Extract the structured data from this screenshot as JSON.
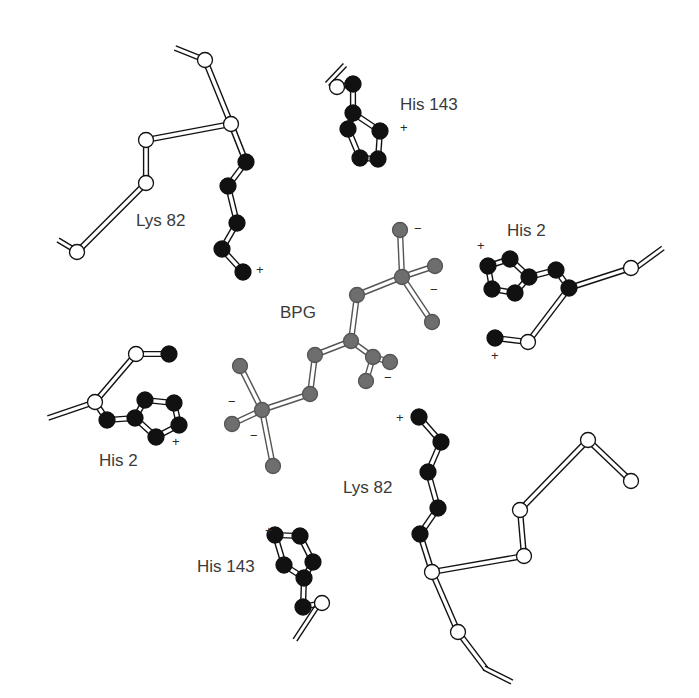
{
  "colors": {
    "backbone_fill": "#ffffff",
    "sidechain_fill": "#111111",
    "bpg_fill": "#6e6e6e",
    "stroke": "#111111",
    "bpg_stroke": "#555555"
  },
  "labels": [
    {
      "id": "lys82-top",
      "text": "Lys 82",
      "x": 136,
      "y": 226
    },
    {
      "id": "his143-top",
      "text": "His 143",
      "x": 400,
      "y": 110
    },
    {
      "id": "his2-right",
      "text": "His 2",
      "x": 507,
      "y": 236
    },
    {
      "id": "bpg",
      "text": "BPG",
      "x": 280,
      "y": 318
    },
    {
      "id": "his2-left",
      "text": "His 2",
      "x": 99,
      "y": 466
    },
    {
      "id": "lys82-bottom",
      "text": "Lys 82",
      "x": 343,
      "y": 493
    },
    {
      "id": "his143-bottom",
      "text": "His 143",
      "x": 197,
      "y": 572
    }
  ],
  "charges": [
    {
      "sign": "+",
      "x": 256,
      "y": 274
    },
    {
      "sign": "+",
      "x": 400,
      "y": 132
    },
    {
      "sign": "+",
      "x": 477,
      "y": 250
    },
    {
      "sign": "+",
      "x": 491,
      "y": 360
    },
    {
      "sign": "+",
      "x": 172,
      "y": 446
    },
    {
      "sign": "+",
      "x": 396,
      "y": 422
    },
    {
      "sign": "+",
      "x": 265,
      "y": 535
    },
    {
      "sign": "−",
      "x": 414,
      "y": 233
    },
    {
      "sign": "−",
      "x": 430,
      "y": 294
    },
    {
      "sign": "−",
      "x": 384,
      "y": 382
    },
    {
      "sign": "−",
      "x": 228,
      "y": 406
    },
    {
      "sign": "−",
      "x": 250,
      "y": 440
    }
  ],
  "stubs": [
    [
      175,
      48,
      205,
      60
    ],
    [
      58,
      240,
      78,
      252
    ],
    [
      327,
      84,
      345,
      65
    ],
    [
      633,
      270,
      663,
      248
    ],
    [
      48,
      418,
      95,
      402
    ],
    [
      295,
      640,
      318,
      605
    ],
    [
      484,
      668,
      512,
      682
    ]
  ],
  "bonds": [
    [
      205,
      60,
      231,
      124,
      "bb"
    ],
    [
      231,
      124,
      146,
      140,
      "bb"
    ],
    [
      146,
      140,
      146,
      183,
      "bb"
    ],
    [
      146,
      183,
      77,
      252,
      "bb"
    ],
    [
      231,
      124,
      246,
      162,
      "bb"
    ],
    [
      246,
      162,
      228,
      186,
      "sc"
    ],
    [
      228,
      186,
      237,
      223,
      "sc"
    ],
    [
      237,
      223,
      222,
      249,
      "sc"
    ],
    [
      222,
      249,
      243,
      272,
      "sc"
    ],
    [
      337,
      87,
      353,
      84,
      "bb"
    ],
    [
      353,
      84,
      353,
      113,
      "sc"
    ],
    [
      353,
      113,
      348,
      129,
      "sc"
    ],
    [
      353,
      113,
      380,
      131,
      "sc"
    ],
    [
      348,
      129,
      360,
      158,
      "sc"
    ],
    [
      380,
      131,
      378,
      159,
      "sc"
    ],
    [
      360,
      158,
      378,
      159,
      "sc"
    ],
    [
      631,
      268,
      569,
      288,
      "bb"
    ],
    [
      569,
      288,
      556,
      270,
      "sc"
    ],
    [
      556,
      270,
      529,
      277,
      "sc"
    ],
    [
      529,
      277,
      510,
      259,
      "sc"
    ],
    [
      510,
      259,
      488,
      266,
      "sc"
    ],
    [
      488,
      266,
      492,
      289,
      "sc"
    ],
    [
      492,
      289,
      515,
      293,
      "sc"
    ],
    [
      515,
      293,
      529,
      277,
      "sc"
    ],
    [
      569,
      288,
      528,
      342,
      "bb"
    ],
    [
      528,
      342,
      495,
      338,
      "bb"
    ],
    [
      95,
      402,
      136,
      354,
      "bb"
    ],
    [
      136,
      354,
      169,
      354,
      "bb"
    ],
    [
      95,
      402,
      107,
      420,
      "sc"
    ],
    [
      107,
      420,
      135,
      418,
      "sc"
    ],
    [
      135,
      418,
      145,
      400,
      "sc"
    ],
    [
      145,
      400,
      174,
      403,
      "sc"
    ],
    [
      174,
      403,
      179,
      425,
      "sc"
    ],
    [
      179,
      425,
      156,
      437,
      "sc"
    ],
    [
      156,
      437,
      135,
      418,
      "sc"
    ],
    [
      419,
      417,
      441,
      442,
      "sc"
    ],
    [
      441,
      442,
      428,
      472,
      "sc"
    ],
    [
      428,
      472,
      438,
      508,
      "sc"
    ],
    [
      438,
      508,
      420,
      534,
      "sc"
    ],
    [
      420,
      534,
      432,
      572,
      "bb"
    ],
    [
      432,
      572,
      524,
      556,
      "bb"
    ],
    [
      524,
      556,
      520,
      510,
      "bb"
    ],
    [
      520,
      510,
      588,
      440,
      "bb"
    ],
    [
      588,
      440,
      631,
      481,
      "bb"
    ],
    [
      432,
      572,
      458,
      632,
      "bb"
    ],
    [
      458,
      632,
      486,
      669,
      "bb"
    ],
    [
      275,
      535,
      300,
      536,
      "sc"
    ],
    [
      275,
      535,
      284,
      565,
      "sc"
    ],
    [
      300,
      536,
      313,
      562,
      "sc"
    ],
    [
      284,
      565,
      304,
      578,
      "sc"
    ],
    [
      313,
      562,
      304,
      578,
      "sc"
    ],
    [
      304,
      578,
      303,
      607,
      "sc"
    ],
    [
      303,
      607,
      322,
      603,
      "bb"
    ],
    [
      400,
      230,
      402,
      277,
      "bpg"
    ],
    [
      402,
      277,
      435,
      266,
      "bpg"
    ],
    [
      402,
      277,
      432,
      322,
      "bpg"
    ],
    [
      402,
      277,
      357,
      295,
      "bpg"
    ],
    [
      357,
      295,
      351,
      341,
      "bpg"
    ],
    [
      351,
      341,
      315,
      355,
      "bpg"
    ],
    [
      351,
      341,
      373,
      357,
      "bpg"
    ],
    [
      373,
      357,
      390,
      362,
      "bpg"
    ],
    [
      373,
      357,
      366,
      381,
      "bpg"
    ],
    [
      315,
      355,
      310,
      394,
      "bpg"
    ],
    [
      310,
      394,
      262,
      410,
      "bpg"
    ],
    [
      262,
      410,
      240,
      366,
      "bpg"
    ],
    [
      262,
      410,
      232,
      424,
      "bpg"
    ],
    [
      262,
      410,
      273,
      466,
      "bpg"
    ]
  ],
  "atoms": [
    {
      "x": 205,
      "y": 60,
      "t": "bb"
    },
    {
      "x": 231,
      "y": 124,
      "t": "bb"
    },
    {
      "x": 146,
      "y": 140,
      "t": "bb"
    },
    {
      "x": 146,
      "y": 183,
      "t": "bb"
    },
    {
      "x": 77,
      "y": 252,
      "t": "bb"
    },
    {
      "x": 246,
      "y": 162,
      "t": "sc"
    },
    {
      "x": 228,
      "y": 186,
      "t": "sc"
    },
    {
      "x": 237,
      "y": 223,
      "t": "sc"
    },
    {
      "x": 222,
      "y": 249,
      "t": "sc"
    },
    {
      "x": 243,
      "y": 272,
      "t": "sc"
    },
    {
      "x": 337,
      "y": 87,
      "t": "bb"
    },
    {
      "x": 353,
      "y": 84,
      "t": "sc"
    },
    {
      "x": 353,
      "y": 113,
      "t": "sc"
    },
    {
      "x": 348,
      "y": 129,
      "t": "sc"
    },
    {
      "x": 380,
      "y": 131,
      "t": "sc"
    },
    {
      "x": 360,
      "y": 158,
      "t": "sc"
    },
    {
      "x": 378,
      "y": 159,
      "t": "sc"
    },
    {
      "x": 631,
      "y": 268,
      "t": "bb"
    },
    {
      "x": 569,
      "y": 288,
      "t": "sc"
    },
    {
      "x": 556,
      "y": 270,
      "t": "sc"
    },
    {
      "x": 529,
      "y": 277,
      "t": "sc"
    },
    {
      "x": 510,
      "y": 259,
      "t": "sc"
    },
    {
      "x": 488,
      "y": 266,
      "t": "sc"
    },
    {
      "x": 492,
      "y": 289,
      "t": "sc"
    },
    {
      "x": 515,
      "y": 293,
      "t": "sc"
    },
    {
      "x": 528,
      "y": 342,
      "t": "bb"
    },
    {
      "x": 495,
      "y": 338,
      "t": "sc"
    },
    {
      "x": 95,
      "y": 402,
      "t": "bb"
    },
    {
      "x": 136,
      "y": 354,
      "t": "bb"
    },
    {
      "x": 169,
      "y": 354,
      "t": "sc"
    },
    {
      "x": 107,
      "y": 420,
      "t": "sc"
    },
    {
      "x": 135,
      "y": 418,
      "t": "sc"
    },
    {
      "x": 145,
      "y": 400,
      "t": "sc"
    },
    {
      "x": 174,
      "y": 403,
      "t": "sc"
    },
    {
      "x": 179,
      "y": 425,
      "t": "sc"
    },
    {
      "x": 156,
      "y": 437,
      "t": "sc"
    },
    {
      "x": 419,
      "y": 417,
      "t": "sc"
    },
    {
      "x": 441,
      "y": 442,
      "t": "sc"
    },
    {
      "x": 428,
      "y": 472,
      "t": "sc"
    },
    {
      "x": 438,
      "y": 508,
      "t": "sc"
    },
    {
      "x": 420,
      "y": 534,
      "t": "sc"
    },
    {
      "x": 432,
      "y": 572,
      "t": "bb"
    },
    {
      "x": 524,
      "y": 556,
      "t": "bb"
    },
    {
      "x": 520,
      "y": 510,
      "t": "bb"
    },
    {
      "x": 588,
      "y": 440,
      "t": "bb"
    },
    {
      "x": 631,
      "y": 481,
      "t": "bb"
    },
    {
      "x": 458,
      "y": 632,
      "t": "bb"
    },
    {
      "x": 275,
      "y": 535,
      "t": "sc"
    },
    {
      "x": 300,
      "y": 536,
      "t": "sc"
    },
    {
      "x": 284,
      "y": 565,
      "t": "sc"
    },
    {
      "x": 313,
      "y": 562,
      "t": "sc"
    },
    {
      "x": 304,
      "y": 578,
      "t": "sc"
    },
    {
      "x": 303,
      "y": 607,
      "t": "sc"
    },
    {
      "x": 322,
      "y": 603,
      "t": "bb"
    },
    {
      "x": 400,
      "y": 230,
      "t": "bpg"
    },
    {
      "x": 435,
      "y": 266,
      "t": "bpg"
    },
    {
      "x": 402,
      "y": 277,
      "t": "bpg"
    },
    {
      "x": 432,
      "y": 322,
      "t": "bpg"
    },
    {
      "x": 357,
      "y": 295,
      "t": "bpg"
    },
    {
      "x": 351,
      "y": 341,
      "t": "bpg"
    },
    {
      "x": 315,
      "y": 355,
      "t": "bpg"
    },
    {
      "x": 373,
      "y": 357,
      "t": "bpg"
    },
    {
      "x": 390,
      "y": 362,
      "t": "bpg"
    },
    {
      "x": 366,
      "y": 381,
      "t": "bpg"
    },
    {
      "x": 310,
      "y": 394,
      "t": "bpg"
    },
    {
      "x": 262,
      "y": 410,
      "t": "bpg"
    },
    {
      "x": 240,
      "y": 366,
      "t": "bpg"
    },
    {
      "x": 232,
      "y": 424,
      "t": "bpg"
    },
    {
      "x": 273,
      "y": 466,
      "t": "bpg"
    }
  ]
}
